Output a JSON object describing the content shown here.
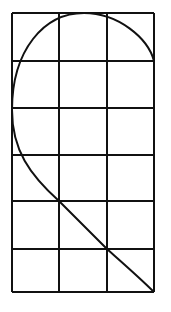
{
  "diagram": {
    "colors": {
      "background": "#ffffff",
      "stroke": "#111111"
    },
    "grid": {
      "columns": 3,
      "rows": 6,
      "x_lines": [
        12,
        59,
        107,
        154
      ],
      "y_lines": [
        13,
        61,
        108,
        155,
        201,
        249,
        292
      ]
    },
    "curve": {
      "path": "M154 61 C 148 38, 118 13, 84 13 C 44 13, 12 50, 12 110 C 12 150, 30 175, 59 201 L 107 249 C 125 265, 140 278, 154 292"
    }
  }
}
